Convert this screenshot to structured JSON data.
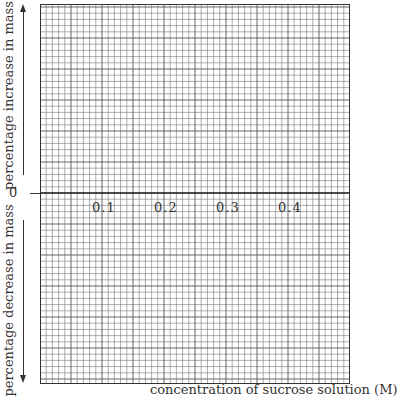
{
  "chart_data": {
    "type": "line",
    "title": "",
    "xlabel": "concentration of sucrose solution (M)",
    "ylabel_upper": "percentage increase in mass",
    "ylabel_lower": "percentage decrease in mass",
    "x_ticks": [
      "0.1",
      "0.2",
      "0.3",
      "0.4"
    ],
    "y_ticks": [
      "0"
    ],
    "grid": true,
    "series": [],
    "note": "Blank graph paper with axes; no plotted data"
  },
  "labels": {
    "upper": "percentage increase in mass",
    "lower": "percentage decrease in mass",
    "zero": "0",
    "x_axis": "concentration of sucrose solution (M)",
    "ticks": [
      "0.1",
      "0.2",
      "0.3",
      "0.4"
    ]
  }
}
